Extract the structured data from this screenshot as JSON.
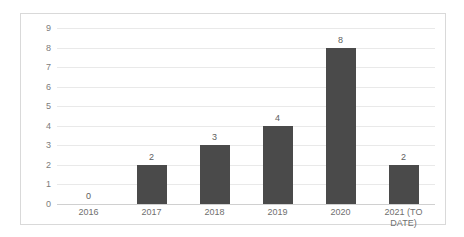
{
  "chart_data": {
    "type": "bar",
    "title": "",
    "subtitle": "",
    "xlabel": "",
    "ylabel": "",
    "categories": [
      "2016",
      "2017",
      "2018",
      "2019",
      "2020",
      "2021 (TO\nDATE)"
    ],
    "values": [
      0,
      2,
      3,
      4,
      8,
      2
    ],
    "data_labels": [
      "0",
      "2",
      "3",
      "4",
      "8",
      "2"
    ],
    "ylim": [
      0,
      9
    ],
    "ytick_labels": [
      "9",
      "8",
      "7",
      "6",
      "5",
      "4",
      "3",
      "2",
      "1",
      "0"
    ],
    "ytick_values": [
      9,
      8,
      7,
      6,
      5,
      4,
      3,
      2,
      1,
      0
    ],
    "grid": "horizontal",
    "legend": "none",
    "series": [
      {
        "name": "",
        "values": [
          0,
          2,
          3,
          4,
          8,
          2
        ]
      }
    ],
    "colors": {
      "bar": "#4a4a4a",
      "gridline": "#e9e9e9",
      "axis": "#d0d0d0",
      "border": "#d9d9d9",
      "background": "#ffffff",
      "tick_text": "#7c7c7c",
      "label_text": "#5e5e5e"
    }
  }
}
